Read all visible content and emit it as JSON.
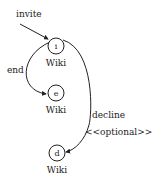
{
  "diagram": {
    "type": "state-diagram",
    "initial": {
      "label": "invite",
      "target": "i"
    },
    "nodes": [
      {
        "id": "i",
        "label": "i",
        "caption": "Wiki"
      },
      {
        "id": "e",
        "label": "e",
        "caption": "Wiki"
      },
      {
        "id": "d",
        "label": "d",
        "caption": "Wiki"
      }
    ],
    "edges": [
      {
        "from": "i",
        "to": "e",
        "label": "end"
      },
      {
        "from": "i",
        "to": "d",
        "label": "decline",
        "stereotype": "<<optional>>"
      }
    ]
  }
}
